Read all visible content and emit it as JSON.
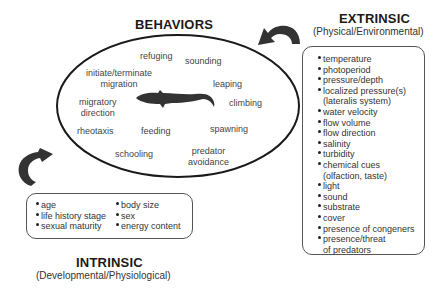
{
  "behaviors": {
    "title": "BEHAVIORS",
    "items": [
      {
        "label": "refuging",
        "x": 152,
        "y": 52
      },
      {
        "label": "sounding",
        "x": 214,
        "y": 56
      },
      {
        "label": "initiate/terminate\nmigration",
        "x": 108,
        "y": 69
      },
      {
        "label": "leaping",
        "x": 240,
        "y": 75
      },
      {
        "label": "migratory\ndirection",
        "x": 95,
        "y": 96
      },
      {
        "label": "climbing",
        "x": 265,
        "y": 96
      },
      {
        "label": "rheotaxis",
        "x": 95,
        "y": 130
      },
      {
        "label": "feeding",
        "x": 155,
        "y": 130
      },
      {
        "label": "spawning",
        "x": 246,
        "y": 126
      },
      {
        "label": "schooling",
        "x": 134,
        "y": 150
      },
      {
        "label": "predator\navoidance",
        "x": 230,
        "y": 148
      }
    ],
    "center_icon": "fish-silhouette-icon"
  },
  "extrinsic": {
    "title": "EXTRINSIC",
    "subtitle": "(Physical/Environmental)",
    "items": [
      "temperature",
      "photoperiod",
      "pressure/depth",
      "localized pressure(s)",
      "(lateralis system)",
      "water velocity",
      "flow volume",
      "flow direction",
      "salinity",
      "turbidity",
      "chemical cues",
      "(olfaction, taste)",
      "light",
      "sound",
      "substrate",
      "cover",
      "presence of congeners",
      "presence/threat",
      "of predators"
    ],
    "continuation_indices": [
      4,
      11,
      18
    ]
  },
  "intrinsic": {
    "title": "INTRINSIC",
    "subtitle": "(Developmental/Physiological)",
    "col1": [
      "age",
      "life history stage",
      "sexual maturity"
    ],
    "col2": [
      "body size",
      "sex",
      "energy content"
    ]
  },
  "arrows": [
    {
      "name": "extrinsic-to-behaviors-arrow",
      "direction": "curved-left"
    },
    {
      "name": "intrinsic-to-behaviors-arrow",
      "direction": "curved-up-right"
    }
  ],
  "colors": {
    "ink": "#1a1a1a",
    "text": "#444444",
    "arrow": "#333333"
  }
}
